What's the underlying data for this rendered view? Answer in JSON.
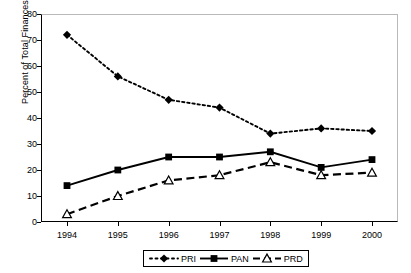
{
  "chart_data": {
    "type": "line",
    "title": "",
    "subtitle": "",
    "xlabel": "",
    "ylabel": "Percent of Total Finances",
    "categories": [
      "1994",
      "1995",
      "1996",
      "1997",
      "1998",
      "1999",
      "2000"
    ],
    "x": [
      1994,
      1995,
      1996,
      1997,
      1998,
      1999,
      2000
    ],
    "xlim": [
      1993.6,
      2000.6
    ],
    "ylim": [
      0,
      80
    ],
    "yticks": [
      0,
      10,
      20,
      30,
      40,
      50,
      60,
      70,
      80
    ],
    "ytick_labels": [
      "0",
      "10",
      "20",
      "30",
      "40",
      "50",
      "60",
      "70",
      "80"
    ],
    "grid": false,
    "legend_position": "bottom-center",
    "series": [
      {
        "name": "PRI",
        "values": [
          72,
          56,
          47,
          44,
          34,
          36,
          35
        ],
        "line_style": "dotted",
        "marker": "diamond-filled",
        "color": "#000000"
      },
      {
        "name": "PAN",
        "values": [
          14,
          20,
          25,
          25,
          27,
          21,
          24
        ],
        "line_style": "solid",
        "marker": "square-filled",
        "color": "#000000"
      },
      {
        "name": "PRD",
        "values": [
          3,
          10,
          16,
          18,
          23,
          18,
          19
        ],
        "line_style": "dashed",
        "marker": "triangle-open",
        "color": "#000000"
      }
    ],
    "legend": [
      {
        "label": "PRI",
        "marker": "diamond-filled",
        "line_style": "dotted"
      },
      {
        "label": "PAN",
        "marker": "square-filled",
        "line_style": "solid"
      },
      {
        "label": "PRD",
        "marker": "triangle-open",
        "line_style": "dashed"
      }
    ],
    "annotations": []
  },
  "colors": {
    "ink": "#000000",
    "frame_light": "#b9b9b9",
    "background": "#ffffff"
  }
}
